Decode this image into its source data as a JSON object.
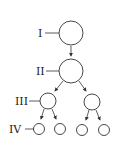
{
  "diagram": {
    "levels": [
      {
        "label": "I",
        "nodes": 1
      },
      {
        "label": "II",
        "nodes": 1
      },
      {
        "label": "III",
        "nodes": 2
      },
      {
        "label": "IV",
        "nodes": 4
      }
    ],
    "colors": {
      "stroke": "#333333",
      "background": "#ffffff"
    }
  }
}
